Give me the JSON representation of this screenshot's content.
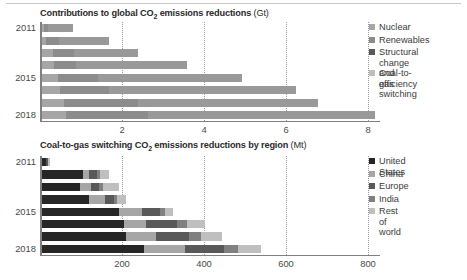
{
  "figure": {
    "width": 467,
    "height": 280
  },
  "colors": {
    "nuclear": "#a6a6a6",
    "renewables": "#8c8c8c",
    "structural": "#595959",
    "coal_to_gas": "#bfbfbf",
    "united_states": "#262626",
    "china": "#a6a6a6",
    "europe": "#595959",
    "india": "#808080",
    "rest_of_world": "#bfbfbf",
    "axis": "#808080",
    "grid": "#9a9a9a",
    "text": "#3b3b3b"
  },
  "chart_data": [
    {
      "id": "top",
      "type": "bar",
      "orientation": "horizontal",
      "stacked": true,
      "title": "Contributions to global CO2 emissions reductions",
      "title_main": "Contributions to global CO",
      "title_sub": "2",
      "title_rest": " emissions reductions",
      "unit": "(Gt)",
      "xlabel": "",
      "ylabel": "",
      "xlim": [
        0,
        8.3
      ],
      "xticks": [
        2,
        4,
        6,
        8
      ],
      "xticklabels": [
        "2",
        "4",
        "6",
        "8"
      ],
      "grid": true,
      "legend_position": "right",
      "categories": [
        "2011",
        "2012",
        "2013",
        "2014",
        "2015",
        "2016",
        "2017",
        "2018"
      ],
      "visible_category_labels": [
        "2011",
        "2015",
        "2018"
      ],
      "series": [
        {
          "name": "Nuclear",
          "values": [
            0.05,
            0.12,
            0.27,
            0.3,
            0.4,
            0.45,
            0.55,
            0.6
          ]
        },
        {
          "name": "Renewables",
          "values": [
            0.12,
            0.3,
            0.53,
            0.55,
            0.99,
            1.2,
            1.8,
            2.0
          ]
        },
        {
          "name": "Structural change and efficiency",
          "values": [
            0.56,
            1.07,
            1.41,
            2.51,
            3.07,
            4.02,
            3.85,
            4.95
          ]
        },
        {
          "name": "Coal-to-gas switching",
          "values": [
            0.05,
            0.15,
            0.15,
            0.2,
            0.44,
            0.54,
            0.55,
            0.58
          ]
        }
      ],
      "legend": [
        {
          "label": "Nuclear",
          "color_key": "nuclear"
        },
        {
          "label": "Renewables",
          "color_key": "renewables"
        },
        {
          "label": "Structural change\nand efficiency",
          "color_key": "structural"
        },
        {
          "label": "Coal-to-gas\nswitching",
          "color_key": "coal_to_gas"
        }
      ]
    },
    {
      "id": "bottom",
      "type": "bar",
      "orientation": "horizontal",
      "stacked": true,
      "title": "Coal-to-gas switching CO2 emissions reductions by region",
      "title_main": "Coal-to-gas switching CO",
      "title_sub": "2",
      "title_rest": " emissions reductions by region",
      "unit": "(Mt)",
      "xlabel": "",
      "ylabel": "",
      "xlim": [
        0,
        830
      ],
      "xticks": [
        200,
        400,
        600,
        800
      ],
      "xticklabels": [
        "200",
        "400",
        "600",
        "800"
      ],
      "grid": true,
      "legend_position": "right",
      "categories": [
        "2011",
        "2012",
        "2013",
        "2014",
        "2015",
        "2016",
        "2017",
        "2018"
      ],
      "visible_category_labels": [
        "2011",
        "2015",
        "2018"
      ],
      "series": [
        {
          "name": "United States",
          "values": [
            10,
            100,
            95,
            115,
            190,
            200,
            205,
            250
          ]
        },
        {
          "name": "China",
          "values": [
            2,
            15,
            25,
            40,
            55,
            55,
            75,
            100
          ]
        },
        {
          "name": "Europe",
          "values": [
            3,
            20,
            20,
            22,
            45,
            75,
            80,
            95
          ]
        },
        {
          "name": "India",
          "values": [
            2,
            8,
            10,
            8,
            12,
            25,
            30,
            35
          ]
        },
        {
          "name": "Rest of world",
          "values": [
            3,
            22,
            40,
            22,
            18,
            45,
            50,
            55
          ]
        }
      ],
      "legend": [
        {
          "label": "United States",
          "color_key": "united_states"
        },
        {
          "label": "China",
          "color_key": "china"
        },
        {
          "label": "Europe",
          "color_key": "europe"
        },
        {
          "label": "India",
          "color_key": "india"
        },
        {
          "label": "Rest of world",
          "color_key": "rest_of_world"
        }
      ]
    }
  ]
}
